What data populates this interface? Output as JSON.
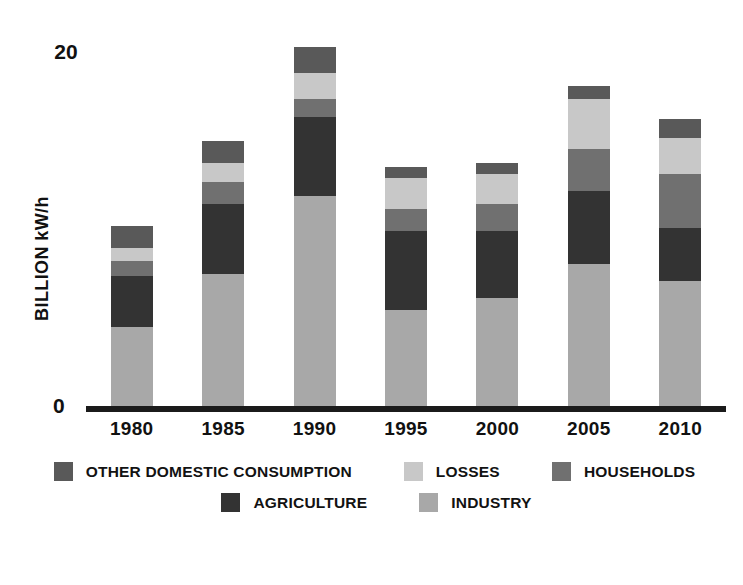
{
  "axis": {
    "y_title": "BILLION kW/h",
    "y_ticks": [
      "20",
      "0"
    ],
    "y_tick_top": "20",
    "y_tick_zero": "0"
  },
  "legend": {
    "rows": [
      [
        {
          "label": "OTHER DOMESTIC CONSUMPTION",
          "color": "#595959",
          "swatch": "legend-swatch-other-domestic-consumption"
        },
        {
          "label": "LOSSES",
          "color": "#c8c8c8",
          "swatch": "legend-swatch-losses"
        },
        {
          "label": "HOUSEHOLDS",
          "color": "#707070",
          "swatch": "legend-swatch-households"
        }
      ],
      [
        {
          "label": "AGRICULTURE",
          "color": "#333333",
          "swatch": "legend-swatch-agriculture"
        },
        {
          "label": "INDUSTRY",
          "color": "#a8a8a8",
          "swatch": "legend-swatch-industry"
        }
      ]
    ]
  },
  "colors": {
    "industry": "#a8a8a8",
    "agriculture": "#333333",
    "households": "#707070",
    "losses": "#c8c8c8",
    "other_domestic_consumption": "#595959",
    "axis": "#1b1b1b",
    "text": "#111111",
    "background": "#ffffff"
  },
  "chart_data": {
    "type": "bar",
    "subtype": "stacked-vertical",
    "title": "",
    "xlabel": "",
    "ylabel": "BILLION kW/h",
    "ylim": [
      0,
      20
    ],
    "yticks": [
      0,
      20
    ],
    "grid": false,
    "legend_position": "bottom",
    "categories": [
      "1980",
      "1985",
      "1990",
      "1995",
      "2000",
      "2005",
      "2010"
    ],
    "series": [
      {
        "name": "INDUSTRY",
        "color": "#a8a8a8",
        "values": [
          4.4,
          7.3,
          11.5,
          5.3,
          6.0,
          7.8,
          6.9
        ]
      },
      {
        "name": "AGRICULTURE",
        "color": "#333333",
        "values": [
          2.8,
          3.8,
          4.3,
          4.3,
          3.6,
          4.0,
          2.9
        ]
      },
      {
        "name": "HOUSEHOLDS",
        "color": "#707070",
        "values": [
          0.8,
          1.2,
          1.0,
          1.2,
          1.5,
          2.3,
          2.9
        ]
      },
      {
        "name": "LOSSES",
        "color": "#c8c8c8",
        "values": [
          0.7,
          1.0,
          1.4,
          1.7,
          1.6,
          2.7,
          2.0
        ]
      },
      {
        "name": "OTHER DOMESTIC CONSUMPTION",
        "color": "#595959",
        "values": [
          1.2,
          1.2,
          1.4,
          0.6,
          0.6,
          0.7,
          1.0
        ]
      }
    ],
    "totals": [
      9.9,
      14.5,
      19.6,
      13.1,
      13.3,
      17.5,
      15.7
    ]
  }
}
